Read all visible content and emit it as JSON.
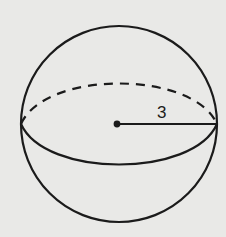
{
  "diagram": {
    "radius_label": "3",
    "background_color": "#e9e9e7",
    "stroke_color": "#1b1b1b",
    "elements": [
      {
        "name": "sphere-outline",
        "type": "circle"
      },
      {
        "name": "equator-back",
        "type": "dashed-arc"
      },
      {
        "name": "equator-front",
        "type": "solid-arc"
      },
      {
        "name": "center-point",
        "type": "dot"
      },
      {
        "name": "radius-line",
        "type": "segment",
        "label": "3"
      }
    ]
  }
}
